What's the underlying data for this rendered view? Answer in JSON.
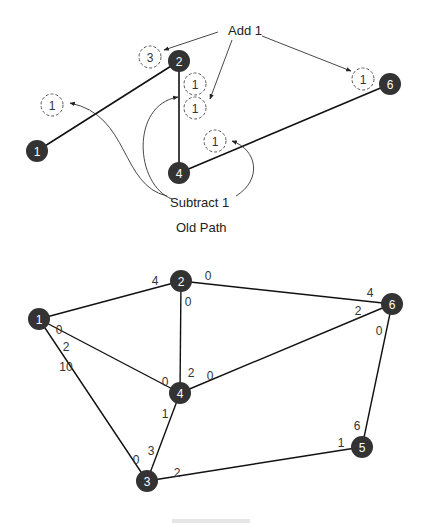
{
  "old_path": {
    "caption": "Old Path",
    "add_label": "Add 1",
    "subtract_label": "Subtract 1",
    "nodes": [
      {
        "id": "1",
        "x": 37,
        "y": 151
      },
      {
        "id": "2",
        "x": 179,
        "y": 61
      },
      {
        "id": "4",
        "x": 179,
        "y": 173
      },
      {
        "id": "6",
        "x": 390,
        "y": 84
      }
    ],
    "edges": [
      [
        "1",
        "2"
      ],
      [
        "2",
        "4"
      ],
      [
        "4",
        "6"
      ]
    ],
    "dashed_markers": [
      {
        "label": "1",
        "x": 52,
        "y": 105
      },
      {
        "label": "3",
        "x": 150,
        "y": 57
      },
      {
        "label": "1",
        "x": 195,
        "y": 84
      },
      {
        "label": "1",
        "x": 195,
        "y": 108
      },
      {
        "label": "1",
        "x": 215,
        "y": 141
      },
      {
        "label": "1",
        "x": 363,
        "y": 79
      }
    ]
  },
  "new_network": {
    "caption": "",
    "nodes": [
      {
        "id": "1",
        "x": 39,
        "y": 319
      },
      {
        "id": "2",
        "x": 181,
        "y": 281
      },
      {
        "id": "3",
        "x": 147,
        "y": 481
      },
      {
        "id": "4",
        "x": 180,
        "y": 393
      },
      {
        "id": "5",
        "x": 362,
        "y": 447
      },
      {
        "id": "6",
        "x": 392,
        "y": 304
      }
    ],
    "edges": [
      {
        "from": "1",
        "to": "2"
      },
      {
        "from": "1",
        "to": "4"
      },
      {
        "from": "1",
        "to": "3"
      },
      {
        "from": "2",
        "to": "4"
      },
      {
        "from": "2",
        "to": "6"
      },
      {
        "from": "4",
        "to": "6"
      },
      {
        "from": "4",
        "to": "3"
      },
      {
        "from": "3",
        "to": "5"
      },
      {
        "from": "5",
        "to": "6"
      }
    ],
    "edge_labels": [
      {
        "text": "0",
        "x": 59,
        "y": 330
      },
      {
        "text": "4",
        "x": 155,
        "y": 281
      },
      {
        "text": "0",
        "x": 208,
        "y": 276
      },
      {
        "text": "0",
        "x": 188,
        "y": 302
      },
      {
        "text": "2",
        "x": 66,
        "y": 347
      },
      {
        "text": "10",
        "x": 66,
        "y": 367
      },
      {
        "text": "0",
        "x": 165,
        "y": 382
      },
      {
        "text": "2",
        "x": 191,
        "y": 373
      },
      {
        "text": "0",
        "x": 210,
        "y": 376
      },
      {
        "text": "4",
        "x": 370,
        "y": 293
      },
      {
        "text": "2",
        "x": 358,
        "y": 311
      },
      {
        "text": "0",
        "x": 379,
        "y": 331
      },
      {
        "text": "1",
        "x": 165,
        "y": 414
      },
      {
        "text": "3",
        "x": 151,
        "y": 451
      },
      {
        "text": "0",
        "x": 136,
        "y": 460
      },
      {
        "text": "2",
        "x": 177,
        "y": 473
      },
      {
        "text": "6",
        "x": 357,
        "y": 426
      },
      {
        "text": "1",
        "x": 341,
        "y": 443
      }
    ]
  }
}
